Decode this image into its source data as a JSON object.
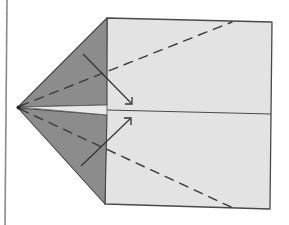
{
  "diagram": {
    "title": "",
    "colors": {
      "background": "#ffffff",
      "paper": "#e3e3e3",
      "flap": "#8c8c8c",
      "wedge": "#e9e9e9",
      "line": "#444444"
    },
    "paths": {
      "left_border": "M7 0 L5 225",
      "paper_rect": "M107 18 L272 22 L270 209 L105 204 Z",
      "upper_flap": "M18 107 L107 18 L107 105 Z",
      "lower_flap": "M18 108 L107 115 L105 204 Z",
      "center_wedge": "M18 107 L107 105 L107 115 Z",
      "center_crease": "M107 110 L271 114",
      "upper_fold_guide": "M20 106 L232 22",
      "lower_fold_guide": "M20 109 L233 208",
      "upper_arrow_shaft": "M83 54 L131 103",
      "upper_arrow_head": "M125 104 L132 104 L132 97",
      "lower_arrow_shaft": "M81 166 L130 119",
      "lower_arrow_head": "M124 118 L131 118 L131 125"
    },
    "tip_point": {
      "cx": "18.5",
      "cy": "107.5",
      "r": "2"
    }
  }
}
